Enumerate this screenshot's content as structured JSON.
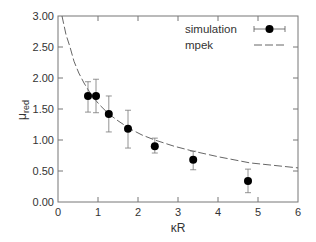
{
  "chart_data": {
    "type": "scatter",
    "title": "",
    "xlabel": "κR",
    "ylabel_main": "μ",
    "ylabel_sub": "red",
    "xlim": [
      0,
      6
    ],
    "ylim": [
      0,
      3
    ],
    "xticks": [
      0,
      1,
      2,
      3,
      4,
      5,
      6
    ],
    "xtick_labels": [
      "0",
      "1",
      "2",
      "3",
      "4",
      "5",
      "6"
    ],
    "yticks": [
      0,
      0.5,
      1.0,
      1.5,
      2.0,
      2.5,
      3.0
    ],
    "ytick_labels": [
      "0.00",
      "0.50",
      "1.00",
      "1.50",
      "2.00",
      "2.50",
      "3.00"
    ],
    "grid": false,
    "legend": {
      "placement": "top-right",
      "entries": [
        "simulation",
        "mpek"
      ]
    },
    "series": [
      {
        "name": "simulation",
        "style": "points-with-errorbars",
        "x": [
          0.75,
          0.95,
          1.27,
          1.75,
          2.42,
          3.38,
          4.75
        ],
        "y": [
          1.71,
          1.71,
          1.42,
          1.18,
          0.9,
          0.68,
          0.34
        ],
        "y_upper": [
          1.94,
          1.98,
          1.71,
          1.48,
          1.03,
          0.82,
          0.53
        ],
        "y_lower": [
          1.45,
          1.44,
          1.13,
          0.87,
          0.79,
          0.52,
          0.15
        ]
      },
      {
        "name": "mpek",
        "style": "dashed-line",
        "x": [
          0.1,
          0.2,
          0.3,
          0.4,
          0.52,
          0.65,
          0.85,
          1.05,
          1.27,
          1.5,
          1.8,
          2.1,
          2.42,
          2.9,
          3.38,
          4.0,
          4.8,
          5.4,
          6.0
        ],
        "y": [
          3.0,
          2.7,
          2.5,
          2.27,
          2.08,
          1.92,
          1.71,
          1.56,
          1.42,
          1.31,
          1.18,
          1.08,
          1.0,
          0.9,
          0.82,
          0.73,
          0.63,
          0.59,
          0.55
        ]
      }
    ]
  }
}
